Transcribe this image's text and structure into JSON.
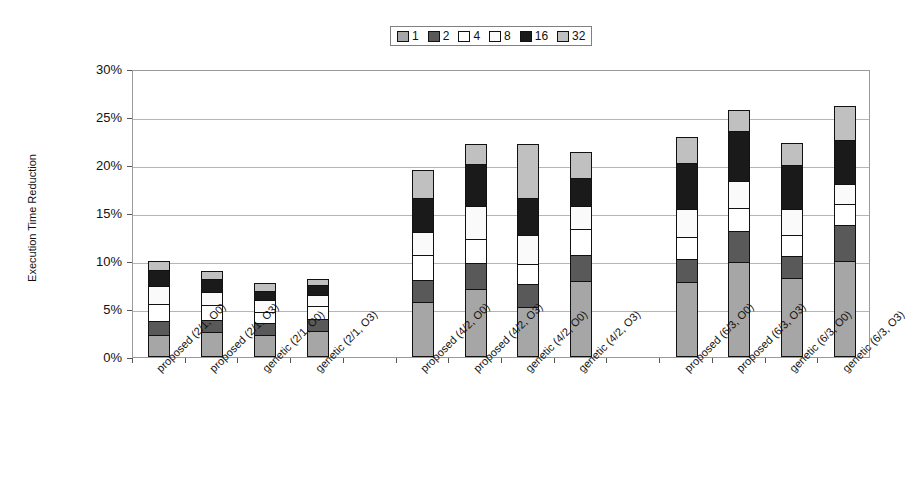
{
  "chart_data": {
    "type": "bar",
    "stacked": true,
    "title": "",
    "xlabel": "",
    "ylabel": "Execution Time Reduction",
    "ylim": [
      0,
      30
    ],
    "ytick_labels": [
      "0%",
      "5%",
      "10%",
      "15%",
      "20%",
      "25%",
      "30%"
    ],
    "ytick_values": [
      0,
      5,
      10,
      15,
      20,
      25,
      30
    ],
    "grid": true,
    "legend_position": "top-center",
    "legend_entries": [
      "1",
      "2",
      "4",
      "8",
      "16",
      "32"
    ],
    "series_colors": [
      "#a6a6a6",
      "#595959",
      "#ffffff",
      "#fafafa",
      "#1a1a1a",
      "#c0c0c0"
    ],
    "categories": [
      "proposed (2/1, O0)",
      "proposed (2/1, O3)",
      "genetic (2/1, O0)",
      "genetic (2/1, O3)",
      "",
      "proposed (4/2, O0)",
      "proposed (4/2, O3)",
      "genetic (4/2, O0)",
      "genetic (4/2, O3)",
      "",
      "proposed (6/3, O0)",
      "proposed (6/3, O3)",
      "genetic (6/3, O0)",
      "genetic (6/3, O3)"
    ],
    "series": [
      {
        "name": "1",
        "values": [
          2.3,
          2.6,
          2.3,
          2.7,
          null,
          5.7,
          7.1,
          5.2,
          7.9,
          null,
          7.8,
          9.9,
          8.2,
          10.0
        ]
      },
      {
        "name": "2",
        "values": [
          1.4,
          1.3,
          1.2,
          1.3,
          null,
          2.3,
          2.7,
          2.4,
          2.7,
          null,
          2.4,
          3.2,
          2.3,
          3.7
        ]
      },
      {
        "name": "4",
        "values": [
          1.8,
          1.5,
          1.2,
          1.3,
          null,
          2.6,
          2.5,
          2.1,
          2.7,
          null,
          2.3,
          2.4,
          2.2,
          2.2
        ]
      },
      {
        "name": "8",
        "values": [
          1.9,
          1.4,
          1.2,
          1.2,
          null,
          2.4,
          3.4,
          3.0,
          2.4,
          null,
          2.9,
          2.8,
          2.7,
          2.1
        ]
      },
      {
        "name": "16",
        "values": [
          1.7,
          1.3,
          1.0,
          1.0,
          null,
          3.6,
          4.4,
          3.9,
          3.0,
          null,
          4.8,
          5.2,
          4.6,
          4.6
        ]
      },
      {
        "name": "32",
        "values": [
          0.9,
          0.9,
          0.8,
          0.6,
          null,
          2.9,
          2.1,
          5.6,
          2.7,
          null,
          2.7,
          2.2,
          2.3,
          3.6
        ]
      }
    ],
    "totals": [
      10.0,
      9.0,
      7.7,
      8.1,
      null,
      19.5,
      22.2,
      22.2,
      21.4,
      null,
      22.9,
      25.7,
      22.3,
      26.2
    ],
    "bar_count": 12,
    "group_count": 3
  },
  "axis": {
    "y_title": "Execution Time Reduction"
  }
}
